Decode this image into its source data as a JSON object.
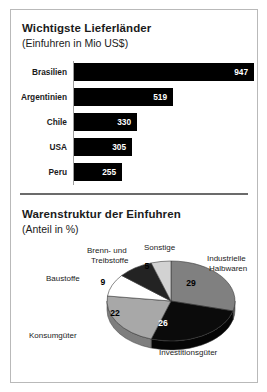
{
  "figure": {
    "background_color": "#ffffff",
    "border_color": "#b9b9b9"
  },
  "chart_data": [
    {
      "type": "bar",
      "title": "Wichtigste Lieferländer",
      "subtitle": "(Einfuhren in Mio US$)",
      "xlabel": "",
      "ylabel": "",
      "orientation": "horizontal",
      "unit": "Mio US$",
      "grid": false,
      "legend": "none",
      "xlim": [
        0,
        947
      ],
      "bar_color": "#000000",
      "value_label_color": "#ffffff",
      "axis_line_color": "#9d9d9d",
      "categories": [
        "Brasilien",
        "Argentinien",
        "Chile",
        "USA",
        "Peru"
      ],
      "values": [
        947,
        519,
        330,
        305,
        255
      ]
    },
    {
      "type": "pie",
      "title": "Warenstruktur der Einfuhren",
      "subtitle": "(Anteil in %)",
      "unit": "%",
      "legend": "labels-around-pie",
      "style": "3d-ellipse",
      "slices": [
        {
          "label": "Industrielle Halbwaren",
          "value": 29,
          "color": "#808080",
          "side_color": "#5e5e5e"
        },
        {
          "label": "Investitionsgüter",
          "value": 26,
          "color": "#0b0b0b",
          "side_color": "#050505"
        },
        {
          "label": "Konsumgüter",
          "value": 22,
          "color": "#a8a8a8",
          "side_color": "#7e7e7e"
        },
        {
          "label": "Baustoffe",
          "value": 9,
          "color": "#ffffff",
          "side_color": "#d0d0d0"
        },
        {
          "label": "Brenn- und Treibstoffe",
          "value": 9,
          "color": "#232323",
          "side_color": "#101010"
        },
        {
          "label": "Sonstige",
          "value": 5,
          "color": "#d2d2d2",
          "side_color": "#a5a5a5"
        }
      ],
      "callout_labels": [
        {
          "text": "Brenn- und",
          "x": 76,
          "y": 8
        },
        {
          "text": "Treibstoffe",
          "x": 80,
          "y": 18
        },
        {
          "text": "Sonstige",
          "x": 133,
          "y": 5
        },
        {
          "text": "Industrielle",
          "x": 196,
          "y": 16
        },
        {
          "text": "Halbwaren",
          "x": 198,
          "y": 26
        },
        {
          "text": "Baustoffe",
          "x": 35,
          "y": 36
        },
        {
          "text": "Konsumgüter",
          "x": 18,
          "y": 93
        },
        {
          "text": "Investitionsgüter",
          "x": 148,
          "y": 110
        }
      ],
      "value_labels": [
        {
          "text": "29",
          "x": 180,
          "y": 48,
          "color": "#000000"
        },
        {
          "text": "26",
          "x": 152,
          "y": 88,
          "color": "#ffffff"
        },
        {
          "text": "22",
          "x": 104,
          "y": 78,
          "color": "#000000"
        },
        {
          "text": "9",
          "x": 92,
          "y": 47,
          "color": "#000000"
        },
        {
          "text": "9",
          "x": 113,
          "y": 32,
          "color": "#ffffff"
        },
        {
          "text": "5",
          "x": 136,
          "y": 31,
          "color": "#000000"
        }
      ]
    }
  ]
}
